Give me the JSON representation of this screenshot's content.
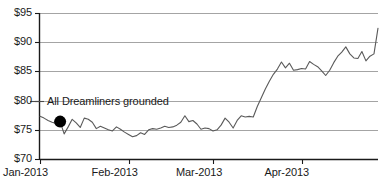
{
  "chart_data": {
    "type": "line",
    "title": "",
    "xlabel": "",
    "ylabel": "",
    "ylim": [
      70,
      95
    ],
    "ytick_values": [
      70,
      75,
      80,
      85,
      90,
      95
    ],
    "ytick_labels": [
      "$70",
      "$75",
      "$80",
      "$85",
      "$90",
      "$95"
    ],
    "xtick_labels": [
      "Jan-2013",
      "Feb-2013",
      "Mar-2013",
      "Apr-2013"
    ],
    "xtick_positions": [
      0,
      22,
      43,
      65
    ],
    "xlim": [
      0,
      84
    ],
    "grid": "horizontal",
    "legend": "none",
    "series": [
      {
        "name": "Boeing share price",
        "color": "#5a5a5a",
        "x": [
          0,
          1,
          2,
          3,
          4,
          5,
          6,
          7,
          8,
          9,
          10,
          11,
          12,
          13,
          14,
          15,
          16,
          17,
          18,
          19,
          20,
          21,
          22,
          23,
          24,
          25,
          26,
          27,
          28,
          29,
          30,
          31,
          32,
          33,
          34,
          35,
          36,
          37,
          38,
          39,
          40,
          41,
          42,
          43,
          44,
          45,
          46,
          47,
          48,
          49,
          50,
          51,
          52,
          53,
          54,
          55,
          56,
          57,
          58,
          59,
          60,
          61,
          62,
          63,
          64,
          65,
          66,
          67,
          68,
          69,
          70,
          71,
          72,
          73,
          74,
          75,
          76,
          77,
          78,
          79,
          80,
          81,
          82,
          83,
          84
        ],
        "values": [
          77.3,
          77.0,
          76.6,
          76.3,
          76.1,
          76.4,
          74.3,
          75.5,
          76.8,
          76.2,
          75.4,
          77.0,
          76.8,
          76.3,
          75.2,
          75.6,
          75.3,
          75.0,
          74.8,
          75.5,
          75.1,
          74.6,
          74.2,
          73.8,
          74.0,
          74.5,
          74.2,
          75.0,
          75.2,
          75.1,
          75.3,
          75.6,
          75.4,
          75.5,
          75.8,
          76.3,
          77.4,
          76.4,
          76.6,
          76.0,
          75.1,
          75.3,
          75.2,
          74.8,
          75.0,
          75.8,
          77.0,
          76.3,
          75.3,
          76.6,
          77.4,
          77.2,
          77.3,
          77.2,
          79.0,
          80.5,
          82.0,
          83.3,
          84.5,
          85.4,
          86.6,
          85.6,
          86.4,
          85.2,
          85.3,
          85.5,
          85.4,
          86.7,
          86.2,
          85.8,
          85.1,
          84.3,
          85.2,
          86.5,
          87.6,
          88.3,
          89.2,
          88.0,
          87.3,
          87.2,
          88.4,
          86.8,
          87.6,
          88.0,
          92.4
        ]
      }
    ],
    "annotations": [
      {
        "text": "All Dreamliners grounded",
        "marker_x": 5,
        "marker_y": 76.4,
        "marker_shape": "filled-circle",
        "marker_color": "#000000"
      }
    ]
  },
  "style": {
    "axis_color": "#1a1a1a",
    "grid_color": "#9a9a9a",
    "line_color": "#5a5a5a",
    "text_color": "#1a1a1a",
    "background": "#ffffff"
  }
}
